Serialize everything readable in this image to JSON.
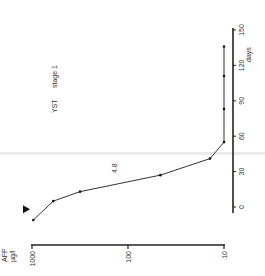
{
  "chart_data": {
    "type": "line",
    "title": "YST stage 1",
    "orientation": "rotated 90° counter-clockwise",
    "xlabel": "days",
    "ylabel": "AFP µg/l",
    "x_ticks": [
      0,
      30,
      60,
      90,
      120,
      150
    ],
    "y_ticks": [
      1000,
      100,
      10
    ],
    "y_scale": "log",
    "xlim": [
      -15,
      155
    ],
    "ylim": [
      10,
      1000
    ],
    "annotation": "4.8",
    "marker_event": {
      "symbol": "triangle",
      "day": -2
    },
    "series": [
      {
        "name": "AFP",
        "x": [
          -11,
          5,
          13,
          27,
          41,
          55,
          83,
          111,
          136
        ],
        "y": [
          970,
          600,
          316,
          46,
          14,
          10,
          10,
          10,
          10
        ]
      }
    ]
  },
  "labels": {
    "title_main": "YST",
    "title_stage": "stage 1",
    "annotation": "4.8",
    "x_axis_unit": "days",
    "y_axis_unit_1": "AFP",
    "y_axis_unit_2": "µg/l",
    "x_ticks": [
      "0",
      "30",
      "60",
      "90",
      "120",
      "150"
    ],
    "y_ticks": [
      "1000",
      "100",
      "10"
    ]
  }
}
